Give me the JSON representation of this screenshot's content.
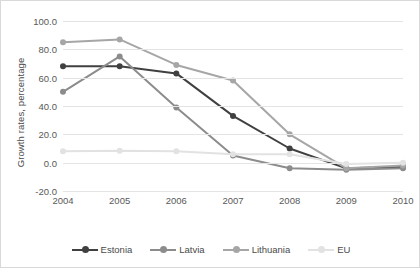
{
  "chart_data": {
    "type": "line",
    "title": "",
    "xlabel": "",
    "ylabel": "Growth rates, percentage",
    "categories": [
      "2004",
      "2005",
      "2006",
      "2007",
      "2008",
      "2009",
      "2010"
    ],
    "ylim": [
      -20.0,
      100.0
    ],
    "yticks": [
      "100.0",
      "80.0",
      "60.0",
      "40.0",
      "20.0",
      "0.0",
      "-20.0"
    ],
    "ytick_values": [
      100.0,
      80.0,
      60.0,
      40.0,
      20.0,
      0.0,
      -20.0
    ],
    "grid": true,
    "legend_position": "bottom",
    "series": [
      {
        "name": "Estonia",
        "color": "#404040",
        "values": [
          68.0,
          68.0,
          63.0,
          33.0,
          10.0,
          -4.0,
          -3.0
        ]
      },
      {
        "name": "Latvia",
        "color": "#8c8c8c",
        "values": [
          50.0,
          75.0,
          39.0,
          5.0,
          -4.0,
          -5.0,
          -4.0
        ]
      },
      {
        "name": "Lithuania",
        "color": "#a6a6a6",
        "values": [
          85.0,
          87.0,
          69.0,
          58.0,
          20.0,
          -4.0,
          -2.0
        ]
      },
      {
        "name": "EU",
        "color": "#e2e2e2",
        "values": [
          8.0,
          8.5,
          8.0,
          6.0,
          6.0,
          -1.0,
          0.0
        ]
      }
    ]
  },
  "legend": {
    "items": [
      {
        "label": "Estonia"
      },
      {
        "label": "Latvia"
      },
      {
        "label": "Lithuania"
      },
      {
        "label": "EU"
      }
    ]
  }
}
